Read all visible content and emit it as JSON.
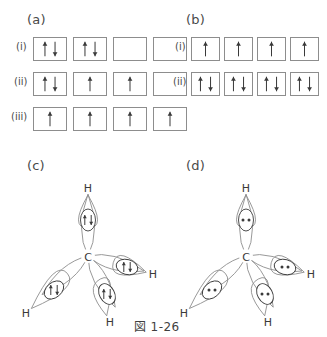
{
  "figure": {
    "caption": "図 1-26",
    "background": "#ffffff",
    "line_color": "#8d8d8d",
    "ink_color": "#3a3a3a"
  },
  "panels": [
    {
      "id": "a",
      "label": "(a)",
      "label_x": 27,
      "label_y": 12,
      "type": "orbital-boxes",
      "rows": [
        {
          "label": "(i)",
          "label_x": 16,
          "label_y": 41,
          "y": 37,
          "boxes": [
            {
              "x": 33,
              "electrons": [
                "up",
                "down"
              ]
            },
            {
              "x": 73,
              "electrons": [
                "up",
                "down"
              ]
            },
            {
              "x": 113,
              "electrons": []
            },
            {
              "x": 153,
              "electrons": []
            }
          ]
        },
        {
          "label": "(ii)",
          "label_x": 14,
          "label_y": 76,
          "y": 72,
          "boxes": [
            {
              "x": 33,
              "electrons": [
                "up",
                "down"
              ]
            },
            {
              "x": 73,
              "electrons": [
                "up"
              ]
            },
            {
              "x": 113,
              "electrons": [
                "up"
              ]
            },
            {
              "x": 153,
              "electrons": []
            }
          ]
        },
        {
          "label": "(iii)",
          "label_x": 11,
          "label_y": 111,
          "y": 107,
          "boxes": [
            {
              "x": 33,
              "electrons": [
                "up"
              ]
            },
            {
              "x": 73,
              "electrons": [
                "up"
              ]
            },
            {
              "x": 113,
              "electrons": [
                "up"
              ]
            },
            {
              "x": 153,
              "electrons": [
                "up"
              ]
            }
          ]
        }
      ]
    },
    {
      "id": "b",
      "label": "(b)",
      "label_x": 186,
      "label_y": 12,
      "type": "orbital-boxes",
      "rows": [
        {
          "label": "(i)",
          "label_x": 175,
          "label_y": 41,
          "y": 37,
          "boxes": [
            {
              "x": 191,
              "electrons": [
                "up"
              ]
            },
            {
              "x": 224,
              "electrons": [
                "up"
              ]
            },
            {
              "x": 257,
              "electrons": [
                "up"
              ]
            },
            {
              "x": 290,
              "electrons": [
                "up"
              ]
            }
          ]
        },
        {
          "label": "(ii)",
          "label_x": 173,
          "label_y": 76,
          "y": 72,
          "boxes": [
            {
              "x": 191,
              "electrons": [
                "up",
                "down"
              ]
            },
            {
              "x": 224,
              "electrons": [
                "up",
                "down"
              ]
            },
            {
              "x": 257,
              "electrons": [
                "up",
                "down"
              ]
            },
            {
              "x": 290,
              "electrons": [
                "up",
                "down"
              ]
            }
          ]
        }
      ]
    },
    {
      "id": "c",
      "label": "(c)",
      "label_x": 27,
      "label_y": 158,
      "type": "molecule",
      "origin_x": 10,
      "origin_y": 170,
      "pair_style": "arrows",
      "center_atom": "C",
      "center": {
        "x": 78,
        "y": 86
      },
      "bonds": [
        {
          "hydrogen": "H",
          "h_x": 78,
          "h_y": 18,
          "pair_x": 78,
          "pair_y": 50,
          "angle": -90,
          "length": 62
        },
        {
          "hydrogen": "H",
          "h_x": 143,
          "h_y": 104,
          "pair_x": 117,
          "pair_y": 97,
          "angle": 15,
          "length": 58
        },
        {
          "hydrogen": "H",
          "h_x": 100,
          "h_y": 152,
          "pair_x": 97,
          "pair_y": 124,
          "angle": 62,
          "length": 58
        },
        {
          "hydrogen": "H",
          "h_x": 16,
          "h_y": 143,
          "pair_x": 44,
          "pair_y": 120,
          "angle": 140,
          "length": 60
        }
      ]
    },
    {
      "id": "d",
      "label": "(d)",
      "label_x": 186,
      "label_y": 158,
      "type": "molecule",
      "origin_x": 168,
      "origin_y": 170,
      "pair_style": "dots",
      "center_atom": "C",
      "center": {
        "x": 78,
        "y": 86
      },
      "bonds": [
        {
          "hydrogen": "H",
          "h_x": 78,
          "h_y": 18,
          "pair_x": 78,
          "pair_y": 50,
          "angle": -90,
          "length": 62
        },
        {
          "hydrogen": "H",
          "h_x": 143,
          "h_y": 104,
          "pair_x": 117,
          "pair_y": 97,
          "angle": 15,
          "length": 58
        },
        {
          "hydrogen": "H",
          "h_x": 100,
          "h_y": 152,
          "pair_x": 97,
          "pair_y": 124,
          "angle": 62,
          "length": 58
        },
        {
          "hydrogen": "H",
          "h_x": 16,
          "h_y": 143,
          "pair_x": 44,
          "pair_y": 120,
          "angle": 140,
          "length": 60
        }
      ]
    }
  ],
  "caption_pos": {
    "x": 134,
    "y": 317
  }
}
